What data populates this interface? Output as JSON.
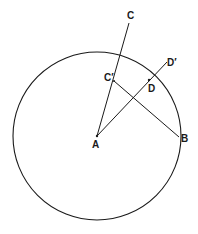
{
  "diagram": {
    "type": "geometry-construction",
    "stroke_color": "#1a1a1a",
    "background": "#ffffff",
    "circle": {
      "center": "A",
      "cx": 97,
      "cy": 136,
      "r": 84
    },
    "points": {
      "A": {
        "label": "A",
        "x": 97,
        "y": 136,
        "label_x": 92,
        "label_y": 148
      },
      "B": {
        "label": "B",
        "x": 179,
        "y": 137,
        "label_x": 181,
        "label_y": 142
      },
      "C": {
        "label": "C",
        "x": 129,
        "y": 23,
        "label_x": 127,
        "label_y": 19
      },
      "C_prime": {
        "label": "C′",
        "x": 114,
        "y": 81,
        "label_x": 104,
        "label_y": 81
      },
      "D": {
        "label": "D",
        "x": 149,
        "y": 80,
        "label_x": 148,
        "label_y": 92
      },
      "D_prime": {
        "label": "D′",
        "x": 167,
        "y": 62,
        "label_x": 167,
        "label_y": 66
      }
    },
    "segments": [
      {
        "name": "segment-a-c",
        "from": "A",
        "to": "C"
      },
      {
        "name": "segment-a-d-prime",
        "from": "A",
        "to": "D_prime"
      },
      {
        "name": "segment-c-prime-b",
        "from": "C_prime",
        "to": "B"
      }
    ],
    "labels": {
      "A": "A",
      "B": "B",
      "C": "C",
      "C_prime": "C′",
      "D": "D",
      "D_prime": "D′"
    }
  }
}
